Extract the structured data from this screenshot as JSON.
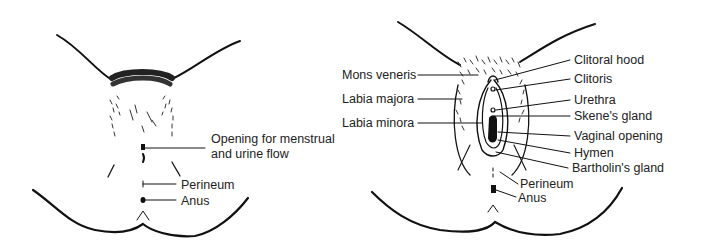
{
  "diagrams": [
    {
      "name": "external-view-closed",
      "labels": [
        {
          "text": "Opening for menstrual",
          "x": 211,
          "y": 132
        },
        {
          "text": "and urine flow",
          "x": 211,
          "y": 147
        },
        {
          "text": "Perineum",
          "x": 181,
          "y": 178
        },
        {
          "text": "Anus",
          "x": 181,
          "y": 194
        }
      ]
    },
    {
      "name": "external-view-open",
      "labels": [
        {
          "text": "Mons veneris",
          "x": 342,
          "y": 68
        },
        {
          "text": "Labia majora",
          "x": 342,
          "y": 92
        },
        {
          "text": "Labia minora",
          "x": 342,
          "y": 116
        },
        {
          "text": "Clitoral hood",
          "x": 574,
          "y": 53
        },
        {
          "text": "Clitoris",
          "x": 574,
          "y": 72
        },
        {
          "text": "Urethra",
          "x": 574,
          "y": 93
        },
        {
          "text": "Skene's gland",
          "x": 574,
          "y": 109
        },
        {
          "text": "Vaginal opening",
          "x": 574,
          "y": 129
        },
        {
          "text": "Hymen",
          "x": 574,
          "y": 146
        },
        {
          "text": "Bartholin's gland",
          "x": 572,
          "y": 161
        },
        {
          "text": "Perineum",
          "x": 520,
          "y": 177
        },
        {
          "text": "Anus",
          "x": 518,
          "y": 191
        }
      ]
    }
  ]
}
